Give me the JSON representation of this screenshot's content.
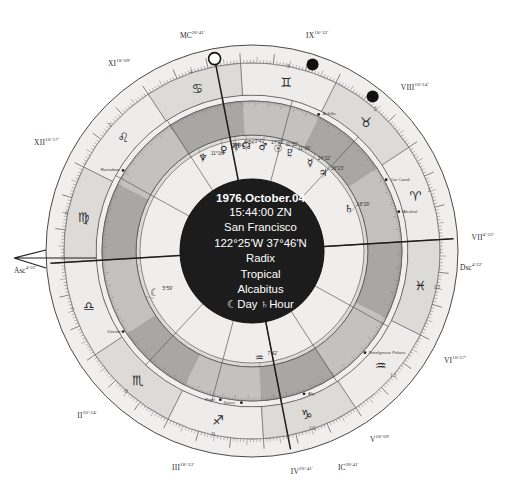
{
  "chart": {
    "type": "astrological-natal-wheel",
    "center": {
      "date": "1976.October.04",
      "time": "15:44:00 ZN",
      "place": "San Francisco",
      "coords": "122°25'W 37°46'N",
      "chart_kind": "Radix",
      "zodiac": "Tropical",
      "house_system": "Alcabitus",
      "rulers": "☾Day ♄Hour"
    },
    "axes": [
      {
        "name": "MC",
        "label": "MC",
        "deg": "20°41'",
        "angle_deg": 101.0
      },
      {
        "name": "Asc",
        "label": "Asc",
        "deg": "4°22'",
        "angle_deg": 183.5
      },
      {
        "name": "Dsc",
        "label": "Dsc",
        "deg": "4°22'",
        "angle_deg": 3.5
      },
      {
        "name": "IC",
        "label": "IC",
        "deg": "20°41'",
        "angle_deg": 281.0
      }
    ],
    "house_cusps": [
      {
        "roman": "IX",
        "deg": "18°33'",
        "angle_deg": 75.0
      },
      {
        "roman": "VIII",
        "deg": "10°24'",
        "angle_deg": 47.0
      },
      {
        "roman": "VII",
        "deg": "4°22'",
        "angle_deg": 3.5
      },
      {
        "roman": "VI",
        "deg": "10°57'",
        "angle_deg": 331.0
      },
      {
        "roman": "V",
        "deg": "18°09'",
        "angle_deg": 303.0
      },
      {
        "roman": "IV",
        "deg": "20°41'",
        "angle_deg": 281.0
      },
      {
        "roman": "III",
        "deg": "18°33'",
        "angle_deg": 255.0
      },
      {
        "roman": "II",
        "deg": "10°24'",
        "angle_deg": 227.0
      },
      {
        "roman": "XII",
        "deg": "10°57'",
        "angle_deg": 151.0
      },
      {
        "roman": "XI",
        "deg": "18°09'",
        "angle_deg": 123.0
      }
    ],
    "house_numbers": [
      "1",
      "2",
      "3",
      "4",
      "5",
      "6",
      "7",
      "8",
      "9",
      "10",
      "11",
      "12"
    ],
    "signs": [
      "♈",
      "♉",
      "♊",
      "♋",
      "♌",
      "♍",
      "♎",
      "♏",
      "♐",
      "♑",
      "♒",
      "♓"
    ],
    "sign_names": [
      "Aries",
      "Taurus",
      "Gemini",
      "Cancer",
      "Leo",
      "Virgo",
      "Libra",
      "Scorpio",
      "Sagittarius",
      "Capricorn",
      "Aquarius",
      "Pisces"
    ],
    "planets": [
      {
        "glyph": "☊",
        "name": "north-node",
        "deg": "3°41'",
        "angle_deg": 93.0
      },
      {
        "glyph": "♅",
        "name": "uranus",
        "deg": "6°54'",
        "angle_deg": 98.5
      },
      {
        "glyph": "♂",
        "name": "mars",
        "deg": "17°22'",
        "angle_deg": 84.0
      },
      {
        "glyph": "♀",
        "name": "venus",
        "deg": "17°44'",
        "angle_deg": 105.5
      },
      {
        "glyph": "♇",
        "name": "pluto",
        "deg": "11°36'",
        "angle_deg": 69.0
      },
      {
        "glyph": "♆",
        "name": "neptune",
        "deg": "11°16'",
        "angle_deg": 117.5
      },
      {
        "glyph": "☉",
        "name": "sun",
        "deg": "11°52'",
        "angle_deg": 76.0
      },
      {
        "glyph": "☿",
        "name": "mercury",
        "deg": "24°32'",
        "angle_deg": 57.0
      },
      {
        "glyph": "♃",
        "name": "jupiter",
        "deg": "16°23'",
        "angle_deg": 48.0
      },
      {
        "glyph": "♄",
        "name": "saturn",
        "deg": "18°29'",
        "angle_deg": 24.0
      },
      {
        "glyph": "☾",
        "name": "moon",
        "deg": "5°59'",
        "angle_deg": 203.0
      },
      {
        "glyph": "♒",
        "name": "chiron",
        "deg": "7°42'",
        "angle_deg": 274.0
      }
    ],
    "fixed_stars": [
      {
        "label": "Rastaban",
        "angle_deg": 148.0
      },
      {
        "label": "Achilla",
        "angle_deg": 64.0
      },
      {
        "label": "Cor Caroli",
        "angle_deg": 28.0
      },
      {
        "label": "Alcohol",
        "angle_deg": 15.0
      },
      {
        "label": "Betelgeuse Polaris",
        "angle_deg": 318.0
      },
      {
        "label": "Deneb",
        "angle_deg": 212.0
      },
      {
        "label": "Sirius",
        "angle_deg": 266.0
      },
      {
        "label": "Rigel",
        "angle_deg": 258.0
      },
      {
        "label": "Alg",
        "angle_deg": 290.0
      }
    ],
    "markers": [
      {
        "name": "mc-marker",
        "kind": "open-circle",
        "angle_deg": 101.0
      },
      {
        "name": "planet-marker-1",
        "kind": "filled-circle",
        "angle_deg": 72.0
      },
      {
        "name": "planet-marker-2",
        "kind": "filled-circle",
        "angle_deg": 52.0
      }
    ],
    "colors": {
      "center_fill": "#1c1c1c",
      "outer_ring": "#f0efee",
      "mid_ring": "#c9c7c4",
      "inner_band": "#9b9996",
      "house_band": "#dcdad7",
      "line": "#4a4a4a"
    }
  }
}
